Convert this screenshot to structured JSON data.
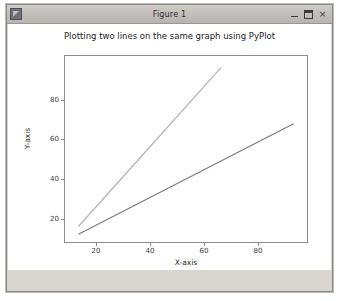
{
  "window": {
    "title": "Figure 1",
    "icon": "matplotlib-figure-icon",
    "controls": {
      "minimize": "–",
      "maximize": "□",
      "close": "×"
    }
  },
  "chart_data": {
    "type": "line",
    "title": "Plotting two lines on the same graph using PyPlot",
    "xlabel": "X-axis",
    "ylabel": "Y-axis",
    "xlim": [
      6,
      96
    ],
    "ylim": [
      2,
      98
    ],
    "xticks": [
      20,
      40,
      60,
      80
    ],
    "yticks": [
      20,
      40,
      60,
      80
    ],
    "grid": false,
    "legend": "none",
    "series": [
      {
        "name": "line-1",
        "color": "#b0b0b0",
        "x": [
          11,
          64
        ],
        "y": [
          10,
          92
        ]
      },
      {
        "name": "line-2",
        "color": "#7a7a7a",
        "x": [
          11,
          91
        ],
        "y": [
          6,
          63
        ]
      }
    ]
  }
}
